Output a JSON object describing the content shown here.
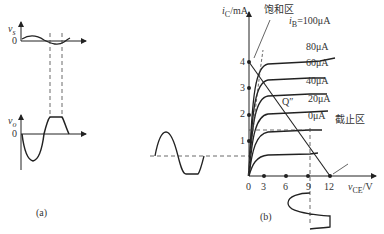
{
  "panel_a": {
    "caption": "(a)",
    "vs_label": "v",
    "vs_sub": "s",
    "vo_label": "v",
    "vo_sub": "o",
    "origin_top": "0",
    "origin_bottom": "0"
  },
  "panel_b": {
    "caption": "(b)",
    "y_axis_label": "i",
    "y_axis_sub": "C",
    "y_axis_unit": "/mA",
    "x_axis_label": "v",
    "x_axis_sub": "CE",
    "x_axis_unit": "/V",
    "saturation_region": "饱和区",
    "cutoff_region": "截止区",
    "q_point_label": "Q″",
    "y_ticks": [
      "1",
      "2",
      "3",
      "4"
    ],
    "x_ticks": [
      "0",
      "3",
      "6",
      "9",
      "12"
    ],
    "ib_prefix": "i",
    "ib_sub": "B",
    "curves": [
      {
        "label": "=100μA"
      },
      {
        "label": "80μA"
      },
      {
        "label": "60μA"
      },
      {
        "label": "40μA"
      },
      {
        "label": "20μA"
      },
      {
        "label": "0μA"
      }
    ]
  }
}
